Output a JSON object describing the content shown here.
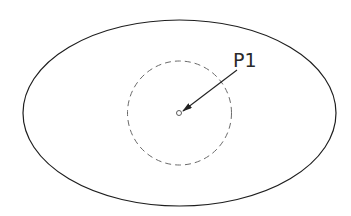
{
  "diagram": {
    "outer_shape": {
      "type": "ellipse",
      "stroke": "#1e1e1e"
    },
    "dashed_circle": {
      "type": "circle",
      "stroke": "#6a6a6a",
      "style": "dashed"
    },
    "center_point": {
      "type": "small-circle",
      "stroke": "#4a4a4a"
    },
    "leader": {
      "type": "arrow",
      "stroke": "#222222"
    },
    "labels": [
      {
        "text": "P1"
      }
    ]
  }
}
